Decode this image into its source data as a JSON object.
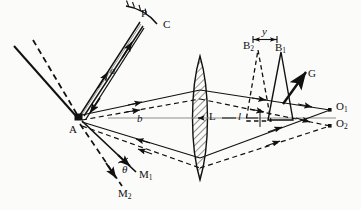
{
  "figure": {
    "type": "optical-ray-diagram",
    "background_color": "#fbfbfa",
    "ink_color": "#111111"
  },
  "labels": {
    "mirror_point": "P",
    "mirror_c": "C",
    "distance_a": "a",
    "distance_b": "b",
    "source_a": "A",
    "lens_l": "L",
    "distance_l": "l",
    "splitter_b1": "B",
    "splitter_b1_sub": "1",
    "splitter_b2": "B",
    "splitter_b2_sub": "2",
    "separation_y": "y",
    "grating_g": "G",
    "image_o1": "O",
    "image_o1_sub": "1",
    "image_o2": "O",
    "image_o2_sub": "2",
    "mirror_m1": "M",
    "mirror_m1_sub": "1",
    "mirror_m2": "M",
    "mirror_m2_sub": "2",
    "angle_theta": "θ"
  },
  "geometry": {
    "point_A": [
      78,
      118
    ],
    "point_P": [
      141,
      20
    ],
    "point_O1": [
      330,
      110
    ],
    "point_O2": [
      330,
      126
    ],
    "lens_center": [
      200,
      118
    ],
    "lens_top": [
      200,
      56
    ],
    "lens_bottom": [
      200,
      180
    ],
    "splitter_b1_apex": [
      281,
      52
    ],
    "splitter_b2_apex": [
      258,
      50
    ],
    "grating_tip": [
      305,
      72
    ],
    "axis_y": 118
  }
}
